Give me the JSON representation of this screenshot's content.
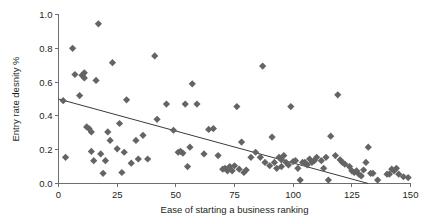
{
  "chart_data": {
    "type": "scatter",
    "title": "",
    "xlabel": "Ease of starting a business ranking",
    "ylabel": "Entry rate desnity %",
    "xlim": [
      0,
      150
    ],
    "ylim": [
      0.0,
      1.0
    ],
    "xticks": [
      "0",
      "25",
      "50",
      "75",
      "100",
      "125",
      "150"
    ],
    "xtick_values": [
      0,
      25,
      50,
      75,
      100,
      125,
      150
    ],
    "yticks": [
      "0.0",
      "0.2",
      "0.4",
      "0.6",
      "0.8",
      "1.0"
    ],
    "ytick_values": [
      0.0,
      0.2,
      0.4,
      0.6,
      0.8,
      1.0
    ],
    "grid": false,
    "legend": "none",
    "marker": {
      "shape": "diamond",
      "color": "#646466",
      "size": 6
    },
    "series": [
      {
        "name": "Countries",
        "points": [
          [
            2,
            0.49
          ],
          [
            3,
            0.155
          ],
          [
            6,
            0.8
          ],
          [
            7,
            0.645
          ],
          [
            9,
            0.52
          ],
          [
            10,
            0.64
          ],
          [
            11,
            0.625
          ],
          [
            11,
            0.655
          ],
          [
            12,
            0.335
          ],
          [
            13,
            0.325
          ],
          [
            14,
            0.19
          ],
          [
            14,
            0.305
          ],
          [
            15,
            0.135
          ],
          [
            16,
            0.61
          ],
          [
            17,
            0.945
          ],
          [
            18,
            0.175
          ],
          [
            19,
            0.06
          ],
          [
            20,
            0.135
          ],
          [
            21,
            0.305
          ],
          [
            22,
            0.255
          ],
          [
            23,
            0.715
          ],
          [
            25,
            0.205
          ],
          [
            26,
            0.355
          ],
          [
            27,
            0.065
          ],
          [
            28,
            0.185
          ],
          [
            29,
            0.495
          ],
          [
            31,
            0.12
          ],
          [
            33,
            0.255
          ],
          [
            34,
            0.145
          ],
          [
            36,
            0.285
          ],
          [
            38,
            0.145
          ],
          [
            41,
            0.755
          ],
          [
            42,
            0.38
          ],
          [
            46,
            0.47
          ],
          [
            49,
            0.315
          ],
          [
            51,
            0.185
          ],
          [
            52,
            0.19
          ],
          [
            53,
            0.18
          ],
          [
            54,
            0.47
          ],
          [
            55,
            0.1
          ],
          [
            56,
            0.215
          ],
          [
            57,
            0.59
          ],
          [
            59,
            0.47
          ],
          [
            62,
            0.175
          ],
          [
            64,
            0.32
          ],
          [
            66,
            0.325
          ],
          [
            68,
            0.165
          ],
          [
            70,
            0.085
          ],
          [
            71,
            0.09
          ],
          [
            72,
            0.075
          ],
          [
            73,
            0.1
          ],
          [
            74,
            0.075
          ],
          [
            75,
            0.105
          ],
          [
            76,
            0.455
          ],
          [
            77,
            0.085
          ],
          [
            78,
            0.245
          ],
          [
            79,
            0.065
          ],
          [
            80,
            0.08
          ],
          [
            82,
            0.155
          ],
          [
            84,
            0.185
          ],
          [
            86,
            0.155
          ],
          [
            87,
            0.695
          ],
          [
            88,
            0.125
          ],
          [
            90,
            0.105
          ],
          [
            91,
            0.275
          ],
          [
            92,
            0.125
          ],
          [
            93,
            0.09
          ],
          [
            94,
            0.155
          ],
          [
            95,
            0.14
          ],
          [
            95,
            0.1
          ],
          [
            96,
            0.165
          ],
          [
            97,
            0.125
          ],
          [
            98,
            0.11
          ],
          [
            99,
            0.455
          ],
          [
            100,
            0.13
          ],
          [
            101,
            0.135
          ],
          [
            102,
            0.09
          ],
          [
            103,
            0.02
          ],
          [
            104,
            0.125
          ],
          [
            105,
            0.125
          ],
          [
            106,
            0.11
          ],
          [
            107,
            0.145
          ],
          [
            108,
            0.125
          ],
          [
            109,
            0.135
          ],
          [
            110,
            0.155
          ],
          [
            112,
            0.135
          ],
          [
            113,
            0.09
          ],
          [
            114,
            0.155
          ],
          [
            115,
            0.02
          ],
          [
            116,
            0.28
          ],
          [
            118,
            0.165
          ],
          [
            119,
            0.525
          ],
          [
            120,
            0.14
          ],
          [
            121,
            0.125
          ],
          [
            122,
            0.115
          ],
          [
            124,
            0.1
          ],
          [
            125,
            0.075
          ],
          [
            126,
            0.065
          ],
          [
            127,
            0.075
          ],
          [
            128,
            0.055
          ],
          [
            129,
            0.045
          ],
          [
            130,
            0.08
          ],
          [
            131,
            0.125
          ],
          [
            132,
            0.215
          ],
          [
            133,
            0.06
          ],
          [
            134,
            0.06
          ],
          [
            136,
            0.02
          ],
          [
            140,
            0.055
          ],
          [
            141,
            0.055
          ],
          [
            142,
            0.085
          ],
          [
            143,
            0.075
          ],
          [
            144,
            0.09
          ],
          [
            145,
            0.055
          ],
          [
            147,
            0.04
          ],
          [
            149,
            0.035
          ]
        ]
      }
    ],
    "trendline": {
      "type": "linear",
      "start": [
        0,
        0.5
      ],
      "end": [
        132,
        0.0
      ],
      "color": "#3b3b3d"
    }
  }
}
